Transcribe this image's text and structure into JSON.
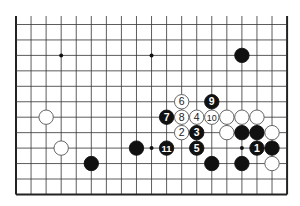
{
  "diagram": {
    "type": "go-board-fragment",
    "columns": 19,
    "visible_rows": 12,
    "top_open": true,
    "edges": [
      "left",
      "right",
      "bottom"
    ],
    "colors": {
      "background": "#ffffff",
      "line": "#333333",
      "edge": "#222222",
      "black": "#111111",
      "white": "#ffffff"
    }
  },
  "star_points": [
    {
      "c": 3,
      "r": 2
    },
    {
      "c": 9,
      "r": 2
    },
    {
      "c": 15,
      "r": 2
    },
    {
      "c": 9,
      "r": 8
    },
    {
      "c": 15,
      "r": 8
    }
  ],
  "stones": [
    {
      "c": 15,
      "r": 2,
      "color": "black",
      "label": ""
    },
    {
      "c": 2,
      "r": 6,
      "color": "white",
      "label": ""
    },
    {
      "c": 3,
      "r": 8,
      "color": "white",
      "label": ""
    },
    {
      "c": 5,
      "r": 9,
      "color": "black",
      "label": ""
    },
    {
      "c": 8,
      "r": 8,
      "color": "black",
      "label": ""
    },
    {
      "c": 10,
      "r": 8,
      "color": "black",
      "label": "11"
    },
    {
      "c": 10,
      "r": 6,
      "color": "black",
      "label": "7"
    },
    {
      "c": 11,
      "r": 5,
      "color": "white",
      "label": "6"
    },
    {
      "c": 11,
      "r": 6,
      "color": "white",
      "label": "8"
    },
    {
      "c": 12,
      "r": 6,
      "color": "white",
      "label": "4"
    },
    {
      "c": 13,
      "r": 6,
      "color": "white",
      "label": "10"
    },
    {
      "c": 13,
      "r": 5,
      "color": "black",
      "label": "9"
    },
    {
      "c": 11,
      "r": 7,
      "color": "white",
      "label": "2"
    },
    {
      "c": 12,
      "r": 7,
      "color": "black",
      "label": "3"
    },
    {
      "c": 12,
      "r": 8,
      "color": "black",
      "label": "5"
    },
    {
      "c": 13,
      "r": 9,
      "color": "black",
      "label": ""
    },
    {
      "c": 14,
      "r": 6,
      "color": "white",
      "label": ""
    },
    {
      "c": 15,
      "r": 6,
      "color": "white",
      "label": ""
    },
    {
      "c": 16,
      "r": 6,
      "color": "white",
      "label": ""
    },
    {
      "c": 14,
      "r": 7,
      "color": "white",
      "label": ""
    },
    {
      "c": 15,
      "r": 7,
      "color": "black",
      "label": ""
    },
    {
      "c": 16,
      "r": 7,
      "color": "black",
      "label": ""
    },
    {
      "c": 17,
      "r": 7,
      "color": "white",
      "label": ""
    },
    {
      "c": 16,
      "r": 8,
      "color": "black",
      "label": "1"
    },
    {
      "c": 17,
      "r": 8,
      "color": "black",
      "label": ""
    },
    {
      "c": 15,
      "r": 9,
      "color": "black",
      "label": ""
    },
    {
      "c": 17,
      "r": 9,
      "color": "white",
      "label": ""
    }
  ]
}
